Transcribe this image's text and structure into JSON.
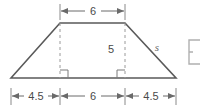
{
  "figure": {
    "shape": "trapezoid",
    "background_color": "#ffffff",
    "outline_color": "#5a5a5a",
    "dash_color": "#9a9a9a",
    "dimension_color": "#6a6a6a",
    "text_color": "#4a4a4a"
  },
  "labels": {
    "top_base": "6",
    "height": "5",
    "slant_side": "s",
    "bottom_left_segment": "4.5",
    "bottom_middle_segment": "6",
    "bottom_right_segment": "4.5"
  },
  "geometry": {
    "top_left_x": 60,
    "top_right_x": 125,
    "top_y": 23,
    "bottom_left_x": 11,
    "bottom_right_x": 176,
    "bottom_y": 78,
    "top_dim_line_y": 11,
    "bottom_dim_line_y": 96
  },
  "markers": {
    "right_angle_left": "right-angle",
    "right_angle_right": "right-angle",
    "edge_fragment": "bracket-fragment"
  }
}
